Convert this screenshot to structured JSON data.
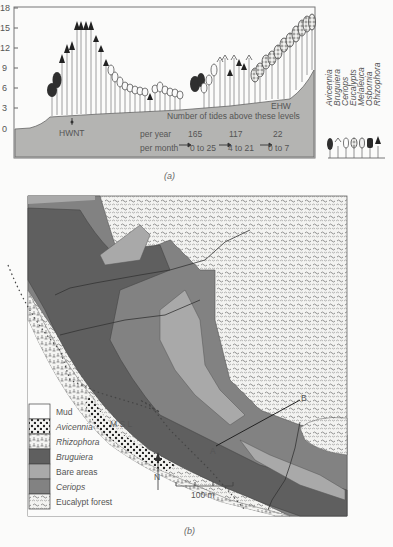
{
  "figure_a": {
    "caption": "(a)",
    "y_axis": {
      "ticks": [
        "18",
        "15",
        "12",
        "9",
        "6",
        "3",
        "0"
      ],
      "min": 0,
      "max": 18
    },
    "labels": {
      "hwnt": "HWNT",
      "ehw": "EHW",
      "tides_title": "Number of tides above these levels",
      "per_year": "per year",
      "per_month": "per month"
    },
    "tides": [
      {
        "per_year": "165",
        "per_month": "0 to 25"
      },
      {
        "per_year": "117",
        "per_month": "4 to 21"
      },
      {
        "per_year": "22",
        "per_month": "0 to 7"
      }
    ],
    "species_legend": [
      "Avicennia",
      "Bruguiera",
      "Ceriops",
      "Eucalypts",
      "Melaleuca",
      "Osbornia",
      "Rhizophora"
    ],
    "colors": {
      "ground": "#b4b4b2",
      "frame": "#777777",
      "tree_dark": "#333333"
    }
  },
  "figure_b": {
    "caption": "(b)",
    "legend": [
      {
        "label": "Mud",
        "italic": false,
        "color": "#fdfdfd",
        "pattern": "none"
      },
      {
        "label": "Avicennia",
        "italic": true,
        "color": "#f4f4f2",
        "pattern": "dots"
      },
      {
        "label": "Rhizophora",
        "italic": true,
        "color": "#f4f4f2",
        "pattern": "rhizo"
      },
      {
        "label": "Bruguiera",
        "italic": true,
        "color": "#5f5f5f",
        "pattern": "none"
      },
      {
        "label": "Bare areas",
        "italic": false,
        "color": "#a9a9a9",
        "pattern": "none"
      },
      {
        "label": "Ceriops",
        "italic": true,
        "color": "#828282",
        "pattern": "none"
      },
      {
        "label": "Eucalypt forest",
        "italic": false,
        "color": "#ededeb",
        "pattern": "forest"
      }
    ],
    "annotations": {
      "msl": "M S L",
      "point_a": "A",
      "point_b": "B",
      "north": "N",
      "scale": "100 m"
    }
  }
}
